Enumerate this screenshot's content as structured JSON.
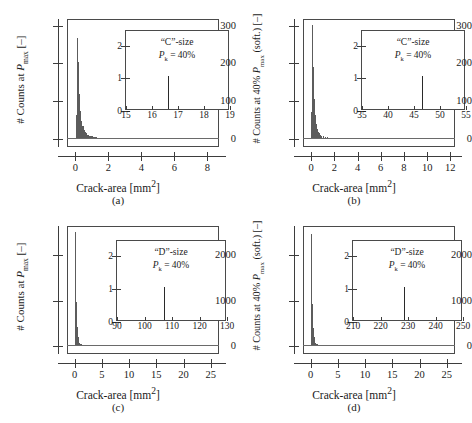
{
  "figure": {
    "layout": "2x2",
    "background": "#ffffff",
    "bar_color": "#5c5c5c",
    "axis_color": "#3d3d3d"
  },
  "panels": [
    {
      "id": "a",
      "caption": "(a)",
      "ylabel_html": "# Counts at <i>P</i><sub>max</sub> [–]",
      "xlabel_html": "Crack-area [mm<sup>2</sup>]",
      "xticks": [
        "0",
        "2",
        "4",
        "6",
        "8"
      ],
      "yticks": [
        "0",
        "100",
        "200",
        "300"
      ],
      "inset": {
        "note_line1": "“C”-size",
        "note_line2_html": "<i>P</i><sub>k</sub> = 40%",
        "xticks": [
          "15",
          "16",
          "17",
          "18",
          "19"
        ],
        "yticks": [
          "0",
          "1",
          "2"
        ],
        "spike_x": 16.6,
        "spike_y": 1
      },
      "chart_ref": 0
    },
    {
      "id": "b",
      "caption": "(b)",
      "ylabel_html": "# Counts at 40% <i>P</i><sub>max</sub> (soft.) [–]",
      "xlabel_html": "Crack-area [mm<sup>2</sup>]",
      "xticks": [
        "0",
        "2",
        "4",
        "6",
        "8",
        "10",
        "12"
      ],
      "yticks": [
        "0",
        "100",
        "200",
        "300"
      ],
      "inset": {
        "note_line1": "“C”-size",
        "note_line2_html": "<i>P</i><sub>k</sub> = 40%",
        "xticks": [
          "35",
          "40",
          "45",
          "50",
          "55"
        ],
        "yticks": [
          "0",
          "1",
          "2"
        ],
        "spike_x": 46.5,
        "spike_y": 1
      },
      "chart_ref": 1
    },
    {
      "id": "c",
      "caption": "(c)",
      "ylabel_html": "# Counts at <i>P</i><sub>max</sub> [–]",
      "xlabel_html": "Crack-area [mm<sup>2</sup>]",
      "xticks": [
        "0",
        "5",
        "10",
        "15",
        "20",
        "25"
      ],
      "yticks": [
        "0",
        "1000",
        "2000"
      ],
      "inset": {
        "note_line1": "“D”-size",
        "note_line2_html": "<i>P</i><sub>k</sub> = 40%",
        "xticks": [
          "90",
          "100",
          "110",
          "120",
          "130"
        ],
        "yticks": [
          "0",
          "1",
          "2"
        ],
        "spike_x": 107,
        "spike_y": 1
      },
      "chart_ref": 2
    },
    {
      "id": "d",
      "caption": "(d)",
      "ylabel_html": "# Counts at 40% <i>P</i><sub>max</sub> (soft.) [–]",
      "xlabel_html": "Crack-area [mm<sup>2</sup>]",
      "xticks": [
        "0",
        "5",
        "10",
        "15",
        "20",
        "25"
      ],
      "yticks": [
        "0",
        "1000",
        "2000"
      ],
      "inset": {
        "note_line1": "“D”-size",
        "note_line2_html": "<i>P</i><sub>k</sub> = 40%",
        "xticks": [
          "210",
          "220",
          "230",
          "240",
          "250"
        ],
        "yticks": [
          "0",
          "1",
          "2"
        ],
        "spike_x": 228.5,
        "spike_y": 1
      },
      "chart_ref": 3
    }
  ],
  "chart_data": [
    {
      "type": "bar",
      "title": "(a) “C”-size, P_k = 40%, counts at P_max",
      "xlabel": "Crack-area [mm^2]",
      "ylabel": "# Counts at P_max [-]",
      "xlim": [
        -0.5,
        8.7
      ],
      "ylim": [
        -22,
        318
      ],
      "xticks": [
        0,
        2,
        4,
        6,
        8
      ],
      "yticks": [
        0,
        100,
        200,
        300
      ],
      "grid": false,
      "bin_width": 0.07,
      "x": [
        0.05,
        0.12,
        0.19,
        0.26,
        0.33,
        0.4,
        0.47,
        0.54,
        0.61,
        0.68,
        0.75,
        0.82,
        0.89,
        0.96,
        1.03,
        1.1,
        1.17,
        1.24,
        1.31,
        1.38,
        1.45,
        1.6,
        1.75,
        1.9,
        2.1,
        2.3,
        2.55,
        2.85,
        3.2,
        3.6,
        4.1,
        4.7,
        5.4,
        6.2,
        7.1,
        8.1
      ],
      "values": [
        62,
        268,
        205,
        120,
        74,
        48,
        33,
        24,
        18,
        14,
        11,
        9,
        8,
        7,
        6,
        5,
        5,
        4,
        4,
        3,
        3,
        3,
        2,
        2,
        2,
        2,
        1,
        1,
        1,
        1,
        1,
        1,
        1,
        1,
        1,
        1
      ],
      "inset": {
        "type": "bar",
        "xlim": [
          15,
          19
        ],
        "ylim": [
          0,
          2.45
        ],
        "xticks": [
          15,
          16,
          17,
          18,
          19
        ],
        "yticks": [
          0,
          1,
          2
        ],
        "x": [
          16.6
        ],
        "values": [
          1
        ],
        "annotation": [
          "“C”-size",
          "P_k = 40%"
        ]
      }
    },
    {
      "type": "bar",
      "title": "(b) “C”-size, P_k = 40%, counts at 40% P_max (softening)",
      "xlabel": "Crack-area [mm^2]",
      "ylabel": "# Counts at 40% P_max (soft.) [-]",
      "xlim": [
        -0.7,
        12.4
      ],
      "ylim": [
        -22,
        318
      ],
      "xticks": [
        0,
        2,
        4,
        6,
        8,
        10,
        12
      ],
      "yticks": [
        0,
        100,
        200,
        300
      ],
      "grid": false,
      "bin_width": 0.08,
      "x": [
        0.05,
        0.13,
        0.21,
        0.29,
        0.37,
        0.45,
        0.53,
        0.61,
        0.69,
        0.77,
        0.85,
        0.93,
        1.05,
        1.2,
        1.4,
        1.65,
        1.95,
        2.3,
        2.7,
        3.2,
        3.8,
        4.5,
        5.3,
        6.2,
        7.2,
        8.4,
        9.7,
        11.1
      ],
      "values": [
        70,
        302,
        190,
        105,
        62,
        40,
        27,
        19,
        14,
        11,
        9,
        7,
        6,
        5,
        4,
        3,
        3,
        2,
        2,
        2,
        2,
        1,
        1,
        1,
        1,
        1,
        1,
        1
      ],
      "inset": {
        "type": "bar",
        "xlim": [
          35,
          55
        ],
        "ylim": [
          0,
          2.45
        ],
        "xticks": [
          35,
          40,
          45,
          50,
          55
        ],
        "yticks": [
          0,
          1,
          2
        ],
        "x": [
          46.5
        ],
        "values": [
          1
        ],
        "annotation": [
          "“C”-size",
          "P_k = 40%"
        ]
      }
    },
    {
      "type": "bar",
      "title": "(c) “D”-size, P_k = 40%, counts at P_max",
      "xlabel": "Crack-area [mm^2]",
      "ylabel": "# Counts at P_max [-]",
      "xlim": [
        -1.4,
        26.5
      ],
      "ylim": [
        -180,
        2650
      ],
      "xticks": [
        0,
        5,
        10,
        15,
        20,
        25
      ],
      "yticks": [
        0,
        1000,
        2000
      ],
      "grid": false,
      "bin_width": 0.14,
      "x": [
        0.07,
        0.21,
        0.35,
        0.49,
        0.63,
        0.77,
        0.91,
        1.1,
        1.35,
        1.65,
        2.0,
        2.45,
        3.0,
        3.7,
        4.5,
        5.5,
        6.7,
        8.2,
        10.0,
        12.2,
        14.8,
        18.0,
        21.5,
        25.0
      ],
      "values": [
        520,
        2520,
        980,
        420,
        200,
        110,
        70,
        48,
        33,
        24,
        18,
        14,
        10,
        8,
        6,
        5,
        4,
        3,
        3,
        2,
        2,
        1,
        1,
        1
      ],
      "inset": {
        "type": "bar",
        "xlim": [
          90,
          130
        ],
        "ylim": [
          0,
          2.45
        ],
        "xticks": [
          90,
          100,
          110,
          120,
          130
        ],
        "yticks": [
          0,
          1,
          2
        ],
        "x": [
          107
        ],
        "values": [
          1
        ],
        "annotation": [
          "“D”-size",
          "P_k = 40%"
        ]
      }
    },
    {
      "type": "bar",
      "title": "(d) “D”-size, P_k = 40%, counts at 40% P_max (softening)",
      "xlabel": "Crack-area [mm^2]",
      "ylabel": "# Counts at 40% P_max (soft.) [-]",
      "xlim": [
        -1.4,
        26.5
      ],
      "ylim": [
        -180,
        2650
      ],
      "xticks": [
        0,
        5,
        10,
        15,
        20,
        25
      ],
      "yticks": [
        0,
        1000,
        2000
      ],
      "grid": false,
      "bin_width": 0.14,
      "x": [
        0.07,
        0.21,
        0.35,
        0.49,
        0.63,
        0.77,
        0.91,
        1.1,
        1.35,
        1.65,
        2.0,
        2.45,
        3.0,
        3.7,
        4.5,
        5.5,
        6.7,
        8.2,
        10.0,
        12.2,
        14.8,
        18.0,
        21.5,
        25.0
      ],
      "values": [
        560,
        2480,
        930,
        400,
        190,
        105,
        66,
        45,
        31,
        22,
        17,
        13,
        10,
        7,
        6,
        5,
        4,
        3,
        2,
        2,
        2,
        1,
        1,
        1
      ],
      "inset": {
        "type": "bar",
        "xlim": [
          210,
          250
        ],
        "ylim": [
          0,
          2.45
        ],
        "xticks": [
          210,
          220,
          230,
          240,
          250
        ],
        "yticks": [
          0,
          1,
          2
        ],
        "x": [
          228.5
        ],
        "values": [
          1
        ],
        "annotation": [
          "“D”-size",
          "P_k = 40%"
        ]
      }
    }
  ]
}
